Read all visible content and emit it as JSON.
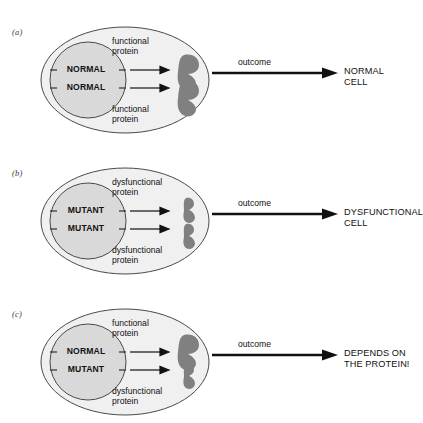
{
  "figure": {
    "colors": {
      "cell_fill": "#f0f0f0",
      "nucleus_fill": "#d9d9d9",
      "protein_fill": "#808080",
      "outline": "#3a3a3a",
      "text": "#111111"
    }
  },
  "panels": [
    {
      "label": "(a)",
      "genes": {
        "top": "NORMAL",
        "bottom": "NORMAL"
      },
      "captions": {
        "top": [
          "functional",
          "protein"
        ],
        "bottom": [
          "functional",
          "protein"
        ]
      },
      "proteins": {
        "top": "functional",
        "bottom": "functional"
      },
      "outcome_label": "outcome",
      "result": [
        "NORMAL",
        "CELL"
      ]
    },
    {
      "label": "(b)",
      "genes": {
        "top": "MUTANT",
        "bottom": "MUTANT"
      },
      "captions": {
        "top": [
          "dysfunctional",
          "protein"
        ],
        "bottom": [
          "dysfunctional",
          "protein"
        ]
      },
      "proteins": {
        "top": "dysfunctional",
        "bottom": "dysfunctional"
      },
      "outcome_label": "outcome",
      "result": [
        "DYSFUNCTIONAL",
        "CELL"
      ]
    },
    {
      "label": "(c)",
      "genes": {
        "top": "NORMAL",
        "bottom": "MUTANT"
      },
      "captions": {
        "top": [
          "functional",
          "protein"
        ],
        "bottom": [
          "dysfunctional",
          "protein"
        ]
      },
      "proteins": {
        "top": "functional",
        "bottom": "dysfunctional"
      },
      "outcome_label": "outcome",
      "result": [
        "DEPENDS ON",
        "THE PROTEIN!"
      ]
    }
  ]
}
